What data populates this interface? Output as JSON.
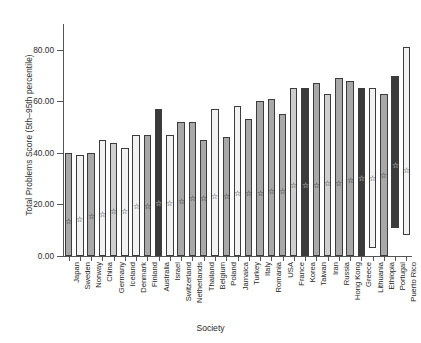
{
  "chart_data": {
    "type": "bar",
    "title": "",
    "xlabel": "Society",
    "ylabel": "Total Problems Score (5th–95th percentile)",
    "ylim": [
      0,
      90
    ],
    "yticks": [
      0,
      20,
      40,
      60,
      80
    ],
    "ytick_labels": [
      "0.00",
      "20.00",
      "40.00",
      "60.00",
      "80.00"
    ],
    "grid": false,
    "legend": "none",
    "bar_kind": "floating range bar (5th to 95th percentile) with mean marker",
    "marker": "star",
    "categories": [
      "Japan",
      "Sweden",
      "Norway",
      "China",
      "Germany",
      "Iceland",
      "Denmark",
      "Finland",
      "Australia",
      "Israel",
      "Switzerland",
      "Netherlands",
      "Thailand",
      "Belgium",
      "Poland",
      "Jamaica",
      "Turkey",
      "Italy",
      "Romania",
      "USA",
      "France",
      "Korea",
      "Taiwan",
      "Iran",
      "Russia",
      "Hong Kong",
      "Greece",
      "Lithuania",
      "Ethiopia",
      "Portugal",
      "Puerto Rico"
    ],
    "series": [
      {
        "name": "5th percentile (bar bottom)",
        "values": [
          0,
          0,
          0,
          0,
          0,
          0,
          0,
          0,
          0,
          0,
          0,
          0,
          0,
          0,
          0,
          0,
          0,
          0,
          0,
          0,
          0,
          0,
          0,
          0,
          0,
          0,
          0,
          3,
          0,
          11,
          8
        ]
      },
      {
        "name": "95th percentile (bar top)",
        "values": [
          40,
          39,
          40,
          45,
          44,
          42,
          47,
          47,
          57,
          47,
          52,
          52,
          45,
          57,
          46,
          58,
          53,
          60,
          61,
          55,
          65,
          65,
          67,
          63,
          69,
          68,
          65,
          65,
          63,
          70,
          81
        ]
      },
      {
        "name": "Mean score (star marker)",
        "values": [
          13,
          14,
          15,
          16,
          17,
          17,
          19,
          19,
          20,
          20,
          21,
          22,
          22,
          23,
          23,
          24,
          24,
          24,
          25,
          25,
          27,
          27,
          27,
          28,
          28,
          29,
          30,
          30,
          31,
          35,
          33
        ]
      }
    ],
    "bar_fills": [
      "mid",
      "light",
      "mid",
      "light",
      "midlight",
      "light",
      "light",
      "mid",
      "dark",
      "light",
      "mid",
      "mid",
      "mid",
      "light",
      "mid",
      "light",
      "mid",
      "mid",
      "mid",
      "mid",
      "midlight",
      "dark",
      "mid",
      "midlight",
      "mid",
      "mid",
      "dark",
      "light",
      "mid",
      "dark",
      "light"
    ]
  },
  "axis": {
    "y_title": "Total Problems Score (5th–95th percentile)",
    "x_title": "Society"
  },
  "marker_glyph": "☆"
}
